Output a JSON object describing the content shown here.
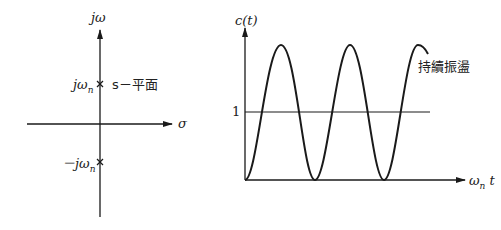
{
  "left_diagram": {
    "title": "s-plane pole plot",
    "vertical_axis_label": "jω",
    "horizontal_axis_label": "σ",
    "plane_label": "s－平面",
    "poles": [
      {
        "label": "jω",
        "subscript": "n",
        "marker": "×"
      },
      {
        "label": "－jω",
        "subscript": "n",
        "marker": "×"
      }
    ]
  },
  "right_diagram": {
    "y_axis_label": "c(t)",
    "x_axis_label": "ω",
    "x_axis_label_sub": "n",
    "x_axis_label_suffix": " t",
    "reference_line_label": "1",
    "annotation": "持續振盪",
    "curve": "sustained oscillation, 1 - cos(ωn t), between 0 and 2"
  },
  "colors": {
    "line": "#1a1a1a",
    "background": "#ffffff"
  }
}
